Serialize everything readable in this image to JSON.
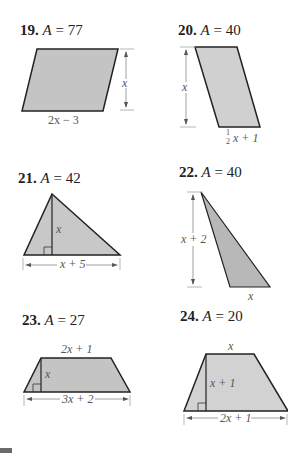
{
  "problems": [
    {
      "number": "19.",
      "area_label": "A",
      "equals": "=",
      "value": "77",
      "shape": "parallelogram",
      "labels": {
        "height": "x",
        "base": "2x − 3"
      }
    },
    {
      "number": "20.",
      "area_label": "A",
      "equals": "=",
      "value": "40",
      "shape": "parallelogram",
      "labels": {
        "height": "x",
        "base_frac": "1",
        "base_frac_den": "2",
        "base": "x + 1"
      }
    },
    {
      "number": "21.",
      "area_label": "A",
      "equals": "=",
      "value": "42",
      "shape": "triangle",
      "labels": {
        "height": "x",
        "base": "x + 5"
      }
    },
    {
      "number": "22.",
      "area_label": "A",
      "equals": "=",
      "value": "40",
      "shape": "triangle",
      "labels": {
        "height": "x + 2",
        "base": "x"
      }
    },
    {
      "number": "23.",
      "area_label": "A",
      "equals": "=",
      "value": "27",
      "shape": "trapezoid",
      "labels": {
        "top": "2x + 1",
        "height": "x",
        "base": "3x + 2"
      }
    },
    {
      "number": "24.",
      "area_label": "A",
      "equals": "=",
      "value": "20",
      "shape": "trapezoid",
      "labels": {
        "top": "x",
        "height": "x + 1",
        "base": "2x + 1"
      }
    }
  ],
  "colors": {
    "fill": "#c4c4c4",
    "fill_light": "#d4d4d4",
    "stroke": "#222222",
    "dim": "#777777"
  }
}
